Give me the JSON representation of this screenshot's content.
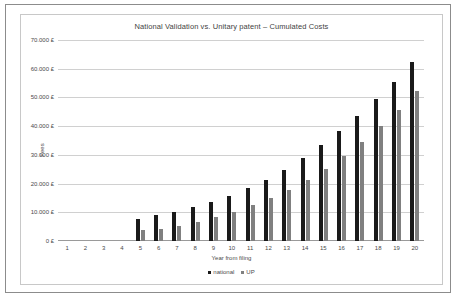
{
  "chart_data": {
    "type": "bar",
    "title": "National Validation vs. Unitary patent – Cumulated Costs",
    "xlabel": "Year from filing",
    "ylabel": "Fees",
    "categories": [
      "1",
      "2",
      "3",
      "4",
      "5",
      "6",
      "7",
      "8",
      "9",
      "10",
      "11",
      "12",
      "13",
      "14",
      "15",
      "16",
      "17",
      "18",
      "19",
      "20"
    ],
    "series": [
      {
        "name": "national",
        "color": "#1a1a1a",
        "values": [
          0,
          0,
          0,
          0,
          7800,
          8900,
          10000,
          11900,
          13600,
          15700,
          18400,
          21200,
          24800,
          28800,
          33400,
          38400,
          43700,
          49300,
          55400,
          62400
        ]
      },
      {
        "name": "UP",
        "color": "#808080",
        "values": [
          0,
          0,
          0,
          0,
          3800,
          4300,
          5400,
          6700,
          8500,
          10100,
          12400,
          15100,
          17900,
          21400,
          25200,
          29600,
          34400,
          40000,
          45800,
          52100
        ]
      }
    ],
    "ylim": [
      0,
      70000
    ],
    "yticks": [
      0,
      10000,
      20000,
      30000,
      40000,
      50000,
      60000,
      70000
    ],
    "ytick_labels": [
      "0 £",
      "10.000 £",
      "20.000 £",
      "30.000 £",
      "40.000 £",
      "50.000 £",
      "60.000 £",
      "70.000 £"
    ],
    "grid": true,
    "legend_position": "bottom",
    "currency_symbol": "£"
  }
}
